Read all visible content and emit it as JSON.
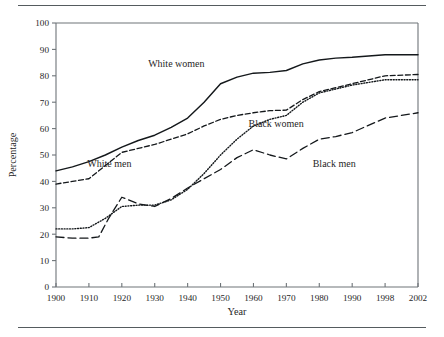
{
  "chart_data": {
    "type": "line",
    "title": "",
    "xlabel": "Year",
    "ylabel": "Percentage",
    "xlim": [
      1900,
      2002
    ],
    "ylim": [
      0,
      100
    ],
    "grid": false,
    "legend_position": "inline-annotations",
    "x_tick_labels": [
      "1900",
      "1910",
      "1920",
      "1930",
      "1940",
      "1950",
      "1960",
      "1970",
      "1980",
      "1990",
      "1998",
      "2002"
    ],
    "x_tick_values": [
      1900,
      1910,
      1920,
      1930,
      1940,
      1950,
      1960,
      1970,
      1980,
      1990,
      1998,
      2002
    ],
    "y_tick_labels": [
      "0",
      "10",
      "20",
      "30",
      "40",
      "50",
      "60",
      "70",
      "80",
      "90",
      "100"
    ],
    "y_tick_values": [
      0,
      10,
      20,
      30,
      40,
      50,
      60,
      70,
      80,
      90,
      100
    ],
    "x": [
      1900,
      1910,
      1920,
      1930,
      1940,
      1950,
      1960,
      1970,
      1980,
      1990,
      1998,
      2002
    ],
    "series": [
      {
        "name": "White women",
        "style": "solid",
        "values": [
          44,
          47.5,
          53,
          57.5,
          64,
          77,
          81,
          82,
          86,
          87,
          88,
          88
        ],
        "label_x": 1928,
        "label_y": 83.5
      },
      {
        "name": "White men",
        "style": "dashed",
        "values": [
          39,
          41,
          51,
          54,
          58,
          63.5,
          66,
          67,
          74,
          77,
          80,
          80.5
        ],
        "label_x": 1909.5,
        "label_y": 45.5
      },
      {
        "name": "Black women",
        "style": "dotted",
        "values": [
          22,
          22.5,
          30.5,
          31,
          37,
          50,
          61,
          65,
          73.5,
          76.5,
          78.5,
          78.5
        ],
        "label_x": 1958.5,
        "label_y": 60.5
      },
      {
        "name": "Black men",
        "style": "longdash",
        "values": [
          19,
          18.5,
          34,
          30.5,
          37.5,
          44.5,
          52,
          48.5,
          56,
          58.5,
          64,
          66
        ],
        "label_x": 1978,
        "label_y": 45.5
      }
    ],
    "series_detail_points": {
      "White women": [
        [
          1900,
          44
        ],
        [
          1905,
          45.5
        ],
        [
          1910,
          47.5
        ],
        [
          1915,
          50
        ],
        [
          1920,
          53
        ],
        [
          1925,
          55.5
        ],
        [
          1930,
          57.5
        ],
        [
          1935,
          60.5
        ],
        [
          1940,
          64
        ],
        [
          1945,
          70
        ],
        [
          1950,
          77
        ],
        [
          1955,
          79.5
        ],
        [
          1960,
          81
        ],
        [
          1965,
          81.3
        ],
        [
          1970,
          82
        ],
        [
          1975,
          84.5
        ],
        [
          1980,
          86
        ],
        [
          1985,
          86.7
        ],
        [
          1990,
          87
        ],
        [
          1998,
          88
        ],
        [
          2002,
          88
        ]
      ],
      "White men": [
        [
          1900,
          39
        ],
        [
          1905,
          40
        ],
        [
          1910,
          41
        ],
        [
          1915,
          46
        ],
        [
          1920,
          51
        ],
        [
          1925,
          52.5
        ],
        [
          1930,
          54
        ],
        [
          1935,
          56
        ],
        [
          1940,
          58
        ],
        [
          1945,
          61
        ],
        [
          1950,
          63.5
        ],
        [
          1955,
          65
        ],
        [
          1960,
          66
        ],
        [
          1965,
          66.8
        ],
        [
          1970,
          67
        ],
        [
          1975,
          71
        ],
        [
          1980,
          74
        ],
        [
          1985,
          75.5
        ],
        [
          1990,
          77
        ],
        [
          1998,
          80
        ],
        [
          2002,
          80.5
        ]
      ],
      "Black women": [
        [
          1900,
          22
        ],
        [
          1905,
          22
        ],
        [
          1910,
          22.5
        ],
        [
          1915,
          26
        ],
        [
          1920,
          30.5
        ],
        [
          1925,
          31
        ],
        [
          1930,
          31
        ],
        [
          1935,
          33
        ],
        [
          1940,
          37
        ],
        [
          1945,
          43
        ],
        [
          1950,
          50
        ],
        [
          1955,
          56
        ],
        [
          1960,
          61
        ],
        [
          1965,
          63.5
        ],
        [
          1970,
          65
        ],
        [
          1975,
          70
        ],
        [
          1980,
          73.5
        ],
        [
          1985,
          75
        ],
        [
          1990,
          76.5
        ],
        [
          1998,
          78.5
        ],
        [
          2002,
          78.5
        ]
      ],
      "Black men": [
        [
          1900,
          19
        ],
        [
          1905,
          18.5
        ],
        [
          1910,
          18.5
        ],
        [
          1913,
          19
        ],
        [
          1916,
          26
        ],
        [
          1920,
          34
        ],
        [
          1925,
          31.5
        ],
        [
          1930,
          30.5
        ],
        [
          1935,
          33.5
        ],
        [
          1940,
          37.5
        ],
        [
          1945,
          41
        ],
        [
          1950,
          44.5
        ],
        [
          1955,
          49
        ],
        [
          1960,
          52
        ],
        [
          1965,
          50
        ],
        [
          1970,
          48.5
        ],
        [
          1975,
          52.5
        ],
        [
          1980,
          56
        ],
        [
          1985,
          57
        ],
        [
          1990,
          58.5
        ],
        [
          1998,
          64
        ],
        [
          2002,
          66
        ]
      ]
    }
  },
  "axes": {
    "x_title": "Year",
    "y_title": "Percentage"
  }
}
